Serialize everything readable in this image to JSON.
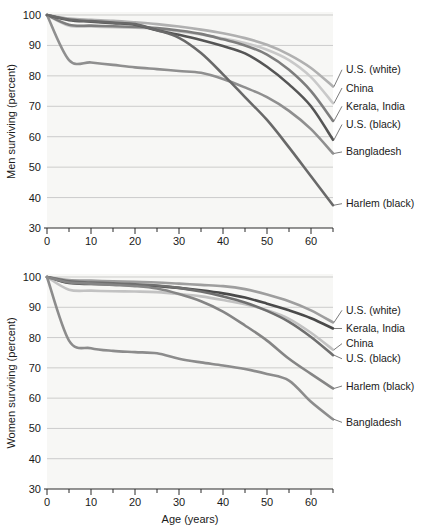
{
  "chart_data": [
    {
      "type": "line",
      "title": "",
      "xlabel": "",
      "ylabel": "Men surviving (percent)",
      "xlim": [
        0,
        65
      ],
      "ylim": [
        30,
        100
      ],
      "xticks": [
        0,
        10,
        20,
        30,
        40,
        50,
        60
      ],
      "xticklabels": [
        "0",
        "10",
        "20",
        "30",
        "40",
        "50",
        "60"
      ],
      "xminorticks": [
        5,
        15,
        25,
        35,
        45,
        55,
        65
      ],
      "yticks": [
        30,
        40,
        50,
        60,
        70,
        80,
        90,
        100
      ],
      "yticklabels": [
        "30",
        "40",
        "50",
        "60",
        "70",
        "80",
        "90",
        "100"
      ],
      "grid": true,
      "legend_position": "right-inline-labels",
      "x": [
        0,
        5,
        10,
        15,
        20,
        25,
        30,
        35,
        40,
        45,
        50,
        55,
        60,
        65
      ],
      "series": [
        {
          "name": "U.S. (white)",
          "color": "#b0b0b0",
          "label_y": 82,
          "values": [
            100,
            98.8,
            98.4,
            98.1,
            97.6,
            97.0,
            96.2,
            95.2,
            94.0,
            92.4,
            90.2,
            87.0,
            82.6,
            76.5
          ]
        },
        {
          "name": "China",
          "color": "#c9c9c9",
          "label_y": 76,
          "values": [
            100,
            96.5,
            96.2,
            96.0,
            95.8,
            95.4,
            94.6,
            93.6,
            92.3,
            90.8,
            88.6,
            85.2,
            79.6,
            71.0
          ]
        },
        {
          "name": "Kerala, India",
          "color": "#7d7d7d",
          "label_y": 70,
          "values": [
            100,
            96.8,
            96.5,
            96.3,
            96.1,
            95.7,
            94.9,
            93.8,
            92.0,
            90.0,
            87.0,
            82.0,
            75.0,
            65.2
          ]
        },
        {
          "name": "U.S. (black)",
          "color": "#555555",
          "label_y": 64,
          "values": [
            100,
            98.3,
            97.8,
            97.3,
            96.8,
            95.0,
            93.5,
            91.8,
            89.8,
            87.4,
            83.0,
            77.2,
            70.0,
            59.0
          ]
        },
        {
          "name": "Bangladesh",
          "color": "#8f8f8f",
          "label_y": 55,
          "values": [
            100,
            85.2,
            84.4,
            83.6,
            82.8,
            82.2,
            81.6,
            81.0,
            79.0,
            76.2,
            73.0,
            68.5,
            62.5,
            54.5
          ]
        },
        {
          "name": "Harlem (black)",
          "color": "#696969",
          "label_y": 38,
          "values": [
            100,
            98.5,
            98.0,
            97.5,
            97.0,
            95.0,
            92.5,
            87.5,
            80.5,
            73.0,
            65.5,
            56.5,
            47.0,
            37.5
          ]
        }
      ]
    },
    {
      "type": "line",
      "title": "",
      "xlabel": "Age (years)",
      "ylabel": "Women surviving (percent)",
      "xlim": [
        0,
        65
      ],
      "ylim": [
        30,
        100
      ],
      "xticks": [
        0,
        10,
        20,
        30,
        40,
        50,
        60
      ],
      "xticklabels": [
        "0",
        "10",
        "20",
        "30",
        "40",
        "50",
        "60"
      ],
      "xminorticks": [
        5,
        15,
        25,
        35,
        45,
        55,
        65
      ],
      "yticks": [
        30,
        40,
        50,
        60,
        70,
        80,
        90,
        100
      ],
      "yticklabels": [
        "30",
        "40",
        "50",
        "60",
        "70",
        "80",
        "90",
        "100"
      ],
      "grid": true,
      "legend_position": "right-inline-labels",
      "x": [
        0,
        5,
        10,
        15,
        20,
        25,
        30,
        35,
        40,
        45,
        50,
        55,
        60,
        65
      ],
      "series": [
        {
          "name": "U.S. (white)",
          "color": "#9e9e9e",
          "label_y": 89,
          "values": [
            100,
            99.0,
            98.8,
            98.6,
            98.4,
            98.2,
            97.8,
            97.4,
            97.0,
            96.0,
            94.2,
            92.0,
            89.0,
            85.0
          ]
        },
        {
          "name": "Kerala, India",
          "color": "#4a4a4a",
          "label_y": 83,
          "values": [
            100,
            98.0,
            97.7,
            97.5,
            97.3,
            97.0,
            96.4,
            95.6,
            94.6,
            93.2,
            91.2,
            89.0,
            86.4,
            83.0
          ]
        },
        {
          "name": "China",
          "color": "#c2c2c2",
          "label_y": 78,
          "values": [
            100,
            95.8,
            95.5,
            95.3,
            95.2,
            95.0,
            94.4,
            93.6,
            92.4,
            91.0,
            89.0,
            86.2,
            81.6,
            76.0
          ]
        },
        {
          "name": "U.S. (black)",
          "color": "#6f6f6f",
          "label_y": 73,
          "values": [
            100,
            98.6,
            98.2,
            97.9,
            97.6,
            97.2,
            96.4,
            95.2,
            93.6,
            91.6,
            88.8,
            85.2,
            80.2,
            74.2
          ]
        },
        {
          "name": "Harlem (black)",
          "color": "#858585",
          "label_y": 64,
          "values": [
            100,
            98.2,
            97.8,
            97.4,
            97.0,
            96.2,
            94.4,
            92.0,
            88.6,
            84.0,
            79.0,
            73.0,
            68.0,
            63.2
          ]
        },
        {
          "name": "Bangladesh",
          "color": "#8c8c8c",
          "label_y": 52,
          "values": [
            100,
            79.0,
            76.5,
            75.6,
            75.2,
            74.8,
            73.0,
            71.8,
            70.8,
            69.6,
            68.0,
            65.8,
            58.8,
            53.0
          ]
        }
      ]
    }
  ]
}
